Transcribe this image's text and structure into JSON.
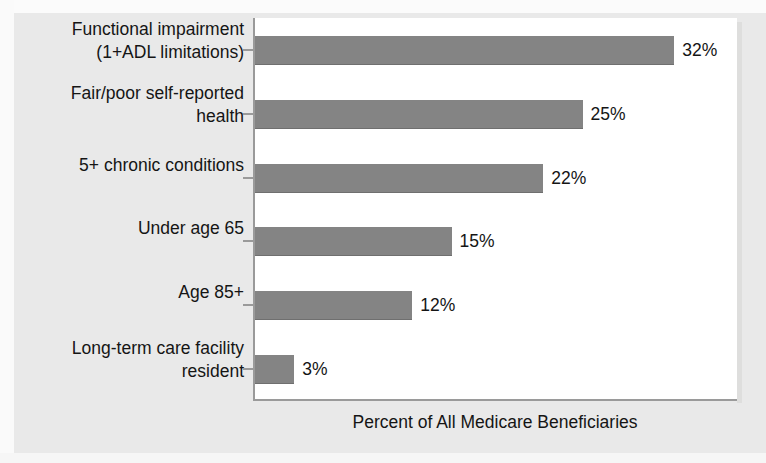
{
  "chart_data": {
    "type": "bar",
    "orientation": "horizontal",
    "title": "",
    "xlabel": "Percent of All Medicare Beneficiaries",
    "ylabel": "",
    "xlim": [
      0,
      37
    ],
    "grid": false,
    "legend": null,
    "value_suffix": "%",
    "categories": [
      "Functional impairment\n(1+ADL limitations)",
      "Fair/poor self-reported\nhealth",
      "5+ chronic conditions",
      "Under age 65",
      "Age 85+",
      "Long-term care facility\nresident"
    ],
    "values": [
      32,
      25,
      22,
      15,
      12,
      3
    ],
    "value_labels": [
      "32%",
      "25%",
      "22%",
      "15%",
      "12%",
      "3%"
    ],
    "colors": {
      "bar": "#848484",
      "plot_background": "#ffffff",
      "figure_background": "#e9e9e9",
      "axis": "#9a9a9a",
      "text": "#151515"
    }
  }
}
